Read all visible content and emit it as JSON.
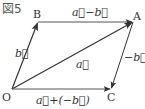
{
  "figure": {
    "title": "図5",
    "points": {
      "O": {
        "label": "O",
        "x": 12,
        "y": 89
      },
      "A": {
        "label": "A",
        "x": 133,
        "y": 22
      },
      "B": {
        "label": "B",
        "x": 38,
        "y": 22
      },
      "C": {
        "label": "C",
        "x": 111,
        "y": 89
      }
    },
    "vectors": [
      {
        "id": "OB",
        "from": "O",
        "to": "B",
        "label": "b⃗"
      },
      {
        "id": "OA",
        "from": "O",
        "to": "A",
        "label": "a⃗"
      },
      {
        "id": "BA",
        "from": "B",
        "to": "A",
        "label": "a⃗−b⃗"
      },
      {
        "id": "AC",
        "from": "A",
        "to": "C",
        "label": "−b⃗"
      },
      {
        "id": "OC",
        "from": "O",
        "to": "C",
        "label": "a⃗+(−b⃗)"
      }
    ],
    "colors": {
      "line": "#333333",
      "line_light": "#555555",
      "text": "#333333"
    }
  }
}
